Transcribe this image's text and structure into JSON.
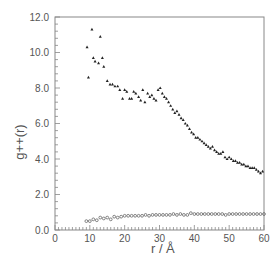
{
  "chart_data": {
    "type": "scatter",
    "title": "",
    "xlabel": "r / Å",
    "ylabel": "g++(r)",
    "xlim": [
      0,
      60
    ],
    "ylim": [
      0,
      12
    ],
    "grid": false,
    "legend": null,
    "x_ticks": [
      0,
      10,
      20,
      30,
      40,
      50,
      60
    ],
    "x_tick_labels": [
      "0",
      "10",
      "20",
      "30",
      "40",
      "50",
      "60"
    ],
    "y_ticks": [
      0,
      2,
      4,
      6,
      8,
      10,
      12
    ],
    "y_tick_labels": [
      "0.0",
      "2.0",
      "4.0",
      "6.0",
      "8.0",
      "10.0",
      "12.0"
    ],
    "series": [
      {
        "name": "upper (filled triangles)",
        "marker": "triangle",
        "x": [
          9.2,
          9.6,
          10.6,
          11.0,
          11.5,
          12.5,
          13.0,
          13.6,
          14.0,
          15.0,
          15.8,
          16.5,
          17.2,
          18.0,
          18.6,
          19.4,
          20.0,
          20.6,
          21.4,
          22.0,
          22.6,
          23.2,
          24.0,
          24.6,
          25.2,
          25.8,
          26.6,
          27.2,
          27.8,
          28.4,
          29.0,
          29.6,
          30.2,
          30.8,
          31.4,
          32.0,
          32.6,
          33.2,
          33.8,
          34.4,
          35.0,
          35.6,
          36.2,
          36.8,
          37.4,
          38.0,
          38.6,
          39.2,
          39.8,
          40.4,
          41.0,
          41.6,
          42.2,
          42.8,
          43.4,
          44.0,
          44.6,
          45.2,
          45.8,
          46.4,
          47.0,
          47.6,
          48.2,
          48.8,
          49.4,
          50.0,
          50.6,
          51.2,
          51.8,
          52.4,
          53.0,
          53.6,
          54.2,
          54.8,
          55.4,
          56.0,
          56.6,
          57.2,
          57.8,
          58.4,
          59.0,
          59.6
        ],
        "y": [
          10.3,
          8.6,
          11.3,
          9.7,
          9.5,
          9.4,
          10.9,
          9.7,
          9.2,
          8.4,
          8.2,
          8.2,
          8.1,
          8.1,
          7.9,
          7.4,
          7.9,
          7.8,
          7.4,
          7.4,
          7.8,
          7.7,
          7.5,
          7.3,
          7.9,
          7.2,
          7.7,
          7.5,
          7.6,
          7.4,
          7.3,
          7.9,
          8.0,
          7.7,
          7.5,
          7.4,
          7.2,
          7.0,
          6.8,
          6.6,
          6.7,
          6.5,
          6.3,
          6.2,
          6.0,
          5.9,
          5.7,
          5.5,
          5.4,
          5.2,
          5.2,
          5.1,
          5.0,
          4.9,
          4.8,
          4.7,
          4.6,
          4.7,
          4.5,
          4.4,
          4.3,
          4.3,
          4.4,
          4.1,
          4.0,
          4.1,
          4.0,
          3.9,
          3.9,
          3.8,
          3.8,
          3.7,
          3.7,
          3.6,
          3.6,
          3.5,
          3.5,
          3.5,
          3.4,
          3.3,
          3.2,
          3.3
        ]
      },
      {
        "name": "lower (open circles)",
        "marker": "circle-open",
        "x": [
          9.0,
          10.0,
          11.0,
          12.0,
          13.0,
          14.0,
          15.0,
          16.0,
          17.0,
          18.0,
          19.0,
          20.0,
          21.0,
          22.0,
          23.0,
          24.0,
          25.0,
          26.0,
          27.0,
          28.0,
          29.0,
          30.0,
          31.0,
          32.0,
          33.0,
          34.0,
          35.0,
          36.0,
          37.0,
          38.0,
          39.0,
          40.0,
          41.0,
          42.0,
          43.0,
          44.0,
          45.0,
          46.0,
          47.0,
          48.0,
          49.0,
          50.0,
          51.0,
          52.0,
          53.0,
          54.0,
          55.0,
          56.0,
          57.0,
          58.0,
          59.0,
          60.0
        ],
        "y": [
          0.5,
          0.5,
          0.6,
          0.55,
          0.7,
          0.65,
          0.7,
          0.6,
          0.75,
          0.7,
          0.75,
          0.8,
          0.8,
          0.8,
          0.8,
          0.8,
          0.8,
          0.85,
          0.8,
          0.85,
          0.85,
          0.85,
          0.85,
          0.85,
          0.85,
          0.9,
          0.85,
          0.9,
          0.85,
          0.85,
          0.95,
          0.9,
          0.9,
          0.9,
          0.9,
          0.9,
          0.9,
          0.9,
          0.9,
          0.9,
          0.85,
          0.9,
          0.9,
          0.9,
          0.9,
          0.9,
          0.9,
          0.9,
          0.9,
          0.9,
          0.9,
          0.9
        ]
      }
    ]
  },
  "labels": {
    "xlabel_r": "r",
    "xlabel_sep": "/",
    "xlabel_unit": "Å",
    "ylabel": "g++(r)"
  }
}
